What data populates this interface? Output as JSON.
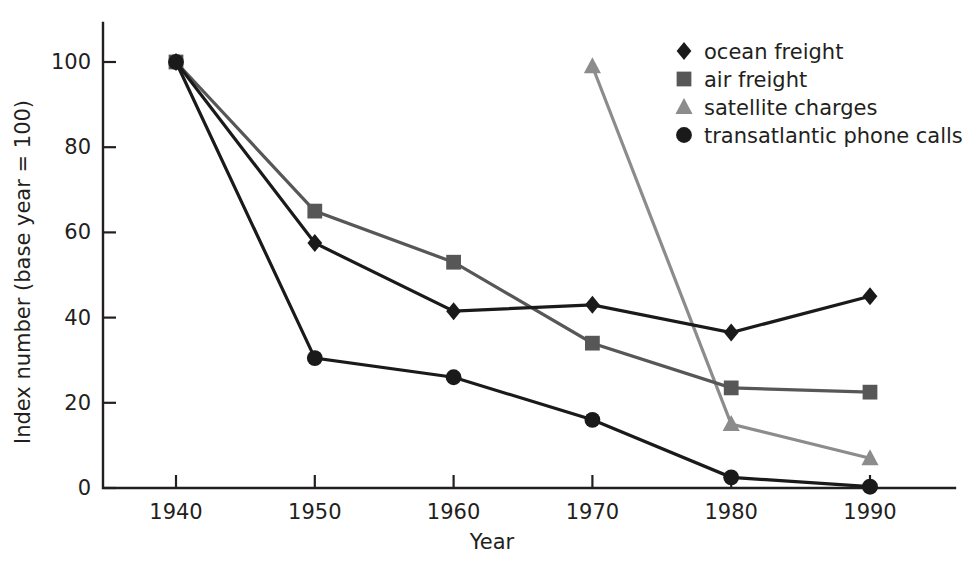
{
  "chart_data": {
    "type": "line",
    "title": "",
    "xlabel": "Year",
    "ylabel": "Index number (base year = 100)",
    "x": [
      1940,
      1950,
      1960,
      1970,
      1980,
      1990
    ],
    "xtick_labels": [
      "1940",
      "1950",
      "1960",
      "1970",
      "1980",
      "1990"
    ],
    "ytick_labels": [
      "0",
      "20",
      "40",
      "60",
      "80",
      "100"
    ],
    "yticks": [
      0,
      20,
      40,
      60,
      80,
      100
    ],
    "xlim": [
      1935,
      1995
    ],
    "ylim": [
      0,
      108
    ],
    "grid": false,
    "legend_position": "top-right",
    "series": [
      {
        "name": "ocean freight",
        "marker": "diamond",
        "color": "#1a1a1a",
        "x": [
          1940,
          1950,
          1960,
          1970,
          1980,
          1990
        ],
        "values": [
          100,
          57.5,
          41.5,
          43,
          36.5,
          45
        ]
      },
      {
        "name": "air freight",
        "marker": "square",
        "color": "#575757",
        "x": [
          1940,
          1950,
          1960,
          1970,
          1980,
          1990
        ],
        "values": [
          100,
          65,
          53,
          34,
          23.5,
          22.5
        ]
      },
      {
        "name": "satellite charges",
        "marker": "triangle",
        "color": "#8c8c8c",
        "x": [
          1970,
          1980,
          1990
        ],
        "values": [
          99,
          15,
          7
        ]
      },
      {
        "name": "transatlantic phone calls",
        "marker": "circle",
        "color": "#1a1a1a",
        "x": [
          1940,
          1950,
          1960,
          1970,
          1980,
          1990
        ],
        "values": [
          100,
          30.5,
          26,
          16,
          2.5,
          0.3
        ]
      }
    ]
  },
  "legend": {
    "entries": [
      {
        "label": "ocean freight",
        "marker": "diamond",
        "color": "#1a1a1a"
      },
      {
        "label": "air freight",
        "marker": "square",
        "color": "#575757"
      },
      {
        "label": "satellite charges",
        "marker": "triangle",
        "color": "#8c8c8c"
      },
      {
        "label": "transatlantic phone calls",
        "marker": "circle",
        "color": "#1a1a1a"
      }
    ]
  },
  "axes": {
    "x_title": "Year",
    "y_title": "Index number (base year = 100)"
  }
}
